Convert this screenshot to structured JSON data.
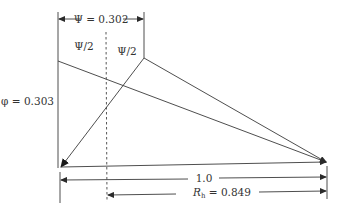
{
  "diagram": {
    "labels": {
      "psi": "Ψ = 0.302",
      "psi_half_left": "Ψ/2",
      "psi_half_right": "Ψ/2",
      "phi": "φ = 0.303",
      "length": "1.0",
      "rh_symbol": "R",
      "rh_subscript": "h",
      "rh_value": " = 0.849"
    },
    "colors": {
      "line": "#3a3a3a",
      "text": "#333333",
      "background": "#ffffff"
    }
  }
}
